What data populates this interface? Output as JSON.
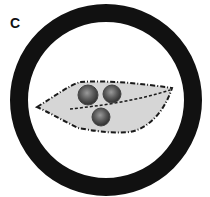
{
  "figure": {
    "panel_label": "C",
    "ring": {
      "cx": 106,
      "cy": 100,
      "outer_r": 96,
      "inner_r": 78,
      "color": "#111111"
    },
    "leaf": {
      "fill": "#d4d4d4",
      "outline": "#1a1a1a",
      "style": "dashed"
    },
    "spores": [
      {
        "cx": 88,
        "cy": 95,
        "r": 10
      },
      {
        "cx": 112,
        "cy": 94,
        "r": 9
      },
      {
        "cx": 101,
        "cy": 117,
        "r": 9
      }
    ]
  }
}
